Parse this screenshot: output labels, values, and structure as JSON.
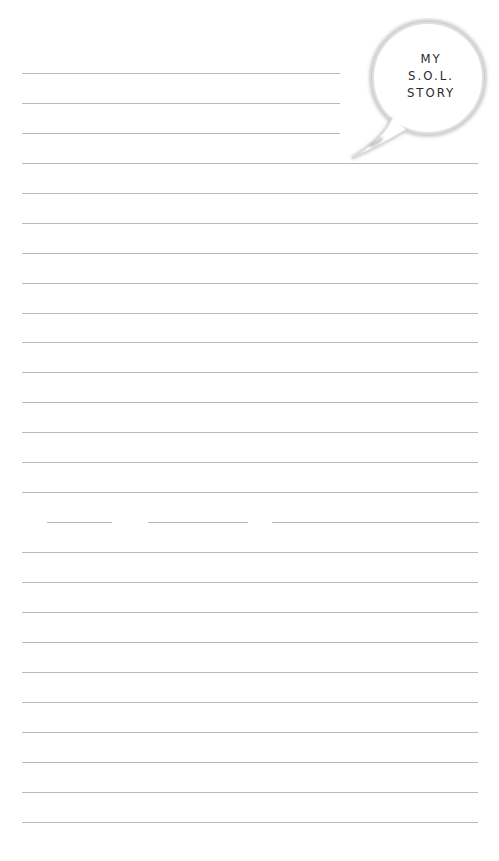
{
  "badge": {
    "lines": [
      "MY",
      "S.O.L.",
      "STORY"
    ]
  },
  "page": {
    "type": "lined-writing-page",
    "line_color": "#b9b9b9",
    "short_lines_top": [
      73,
      103,
      133
    ],
    "full_lines": [
      163,
      193,
      223,
      253,
      283,
      313,
      342,
      372,
      402,
      432,
      462,
      492,
      552,
      582,
      612,
      642,
      672,
      702,
      732,
      762,
      792,
      822
    ],
    "broken_line_y": 522
  }
}
